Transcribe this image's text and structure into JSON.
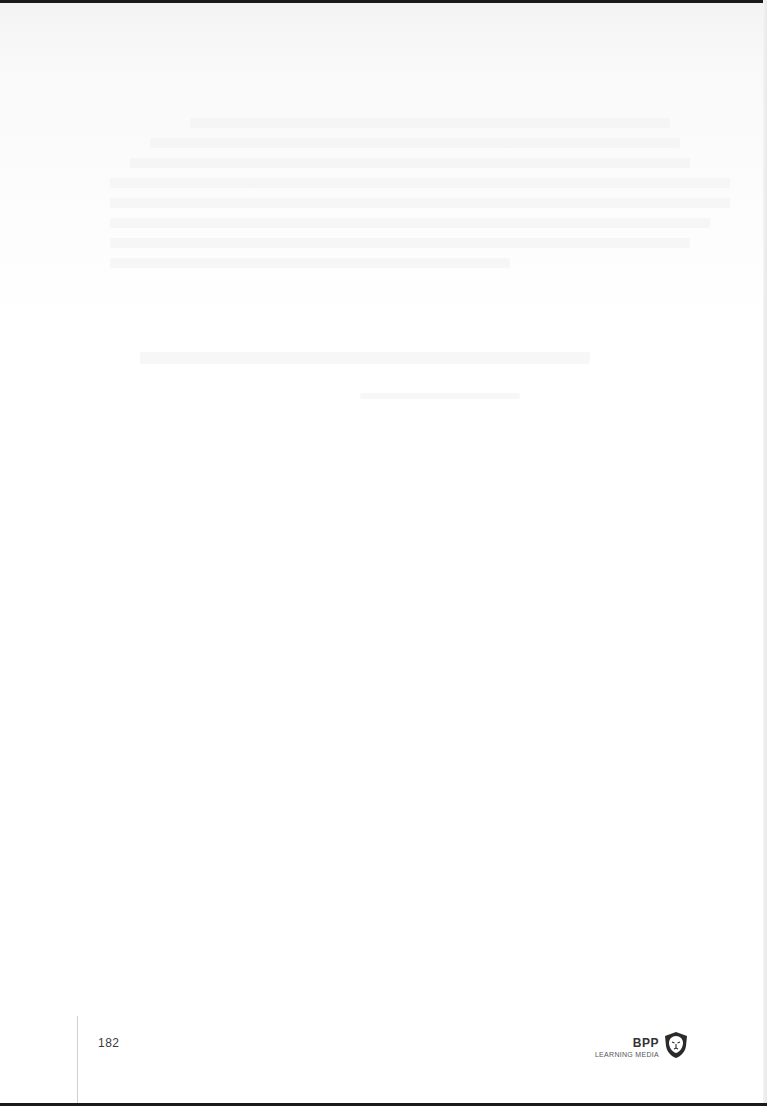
{
  "page": {
    "page_number": "182",
    "footer_logo": {
      "brand": "BPP",
      "subtitle": "LEARNING MEDIA",
      "icon": "lion-shield-icon"
    },
    "colors": {
      "background": "#ffffff",
      "edge": "#1a1a1a",
      "rule": "#cfcfcf",
      "text": "#3a3a3a"
    }
  }
}
